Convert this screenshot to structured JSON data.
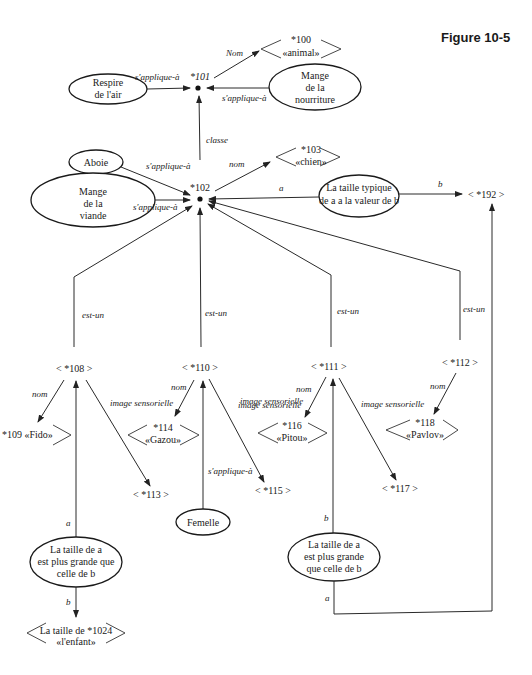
{
  "figure": {
    "title": "Figure 10-5"
  },
  "nodes": {
    "n101": {
      "id": "*101"
    },
    "n102": {
      "id": "*102"
    },
    "n100": {
      "line1": "*100",
      "line2": "«animal»"
    },
    "n103": {
      "line1": "*103",
      "line2": "«chien»"
    },
    "n192": {
      "label": "< *192 >"
    },
    "respire": {
      "line1": "Respire",
      "line2": "de l'air"
    },
    "mange_nourriture": {
      "line1": "Mange",
      "line2": "de la",
      "line3": "nourriture"
    },
    "aboie": {
      "line1": "Aboie"
    },
    "mange_viande": {
      "line1": "Mange",
      "line2": "de la",
      "line3": "viande"
    },
    "taille_typique": {
      "line1": "La taille typique",
      "line2": "de a a la valeur de b"
    },
    "n108": {
      "label": "< *108 >"
    },
    "n110": {
      "label": "< *110 >"
    },
    "n111": {
      "label": "< *111 >"
    },
    "n112": {
      "label": "< *112 >"
    },
    "n109": {
      "label": "*109 «Fido»"
    },
    "n114": {
      "line1": "*114",
      "line2": "«Gazou»"
    },
    "n116": {
      "line1": "*116",
      "line2": "«Pitou»"
    },
    "n118": {
      "line1": "*118",
      "line2": "«Pavlov»"
    },
    "n113": {
      "label": "< *113 >"
    },
    "n115": {
      "label": "< *115 >"
    },
    "n117": {
      "label": "< *117 >"
    },
    "femelle": {
      "line1": "Femelle"
    },
    "taille_plus_grande_1": {
      "line1": "La taille de a",
      "line2": "est plus grande que",
      "line3": "celle de b"
    },
    "taille_plus_grande_2": {
      "line1": "La taille de a",
      "line2": "est plus grande",
      "line3": "que celle de b"
    },
    "n1024": {
      "line1": "La taille de *1024",
      "line2": "«l'enfant»"
    }
  },
  "edges": {
    "nom_101": "Nom",
    "sapplique_respire": "s'applique-à",
    "sapplique_nourriture": "s'applique-à",
    "classe": "classe",
    "sapplique_aboie": "s'applique-à",
    "sapplique_viande": "s'applique-à",
    "nom_102": "nom",
    "a_typique": "a",
    "b_typique": "b",
    "estun_108": "est-un",
    "estun_110": "est-un",
    "estun_111": "est-un",
    "estun_112": "est-un",
    "nom_108": "nom",
    "img_108": "image sensorielle",
    "nom_110": "nom",
    "img_110": "image sensorielle",
    "sapplique_femelle": "s'applique-à",
    "nom_111": "nom",
    "img_111": "image sensorielle",
    "nom_112": "nom",
    "a_plus1": "a",
    "b_plus1": "b",
    "b_plus2": "b",
    "a_plus2": "a"
  }
}
